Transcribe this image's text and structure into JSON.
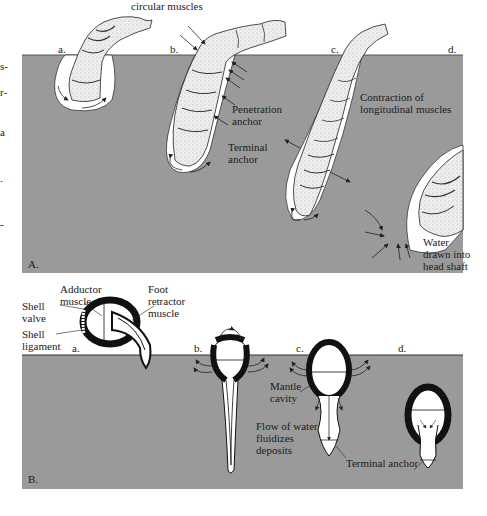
{
  "figure": {
    "panel_a": {
      "letter": "A.",
      "top_label": "circular muscles",
      "stage_labels": [
        "a.",
        "b.",
        "c.",
        "d."
      ],
      "annotations": {
        "penetration_anchor": [
          "Penetration",
          "anchor"
        ],
        "terminal_anchor": [
          "Terminal",
          "anchor"
        ],
        "contraction": [
          "Contraction of",
          "longitudinal muscles"
        ],
        "water_drawn": [
          "Water",
          "drawn into",
          "head shaft"
        ]
      }
    },
    "panel_b": {
      "letter": "B.",
      "stage_labels": [
        "a.",
        "b.",
        "c.",
        "d."
      ],
      "annotations": {
        "adductor_muscle": [
          "Adductor",
          "muscle"
        ],
        "foot_retractor_muscle": [
          "Foot",
          "retractor",
          "muscle"
        ],
        "shell_valve": [
          "Shell",
          "valve"
        ],
        "shell_ligament": [
          "Shell",
          "ligament"
        ],
        "mantle_cavity": [
          "Mantle",
          "cavity"
        ],
        "flow_of_water": [
          "Flow of water",
          "fluidizes",
          "deposits"
        ],
        "terminal_anchor": "Terminal anchor"
      }
    },
    "left_margin_fragments": [
      "s-",
      "r-",
      "a",
      ".",
      "-"
    ],
    "colors": {
      "sediment": "#9a9a9a",
      "sediment_edge": "#5a5a5a",
      "shell": "#111111",
      "worm_fill": "#f2f2f2",
      "burrow": "#ffffff"
    }
  }
}
